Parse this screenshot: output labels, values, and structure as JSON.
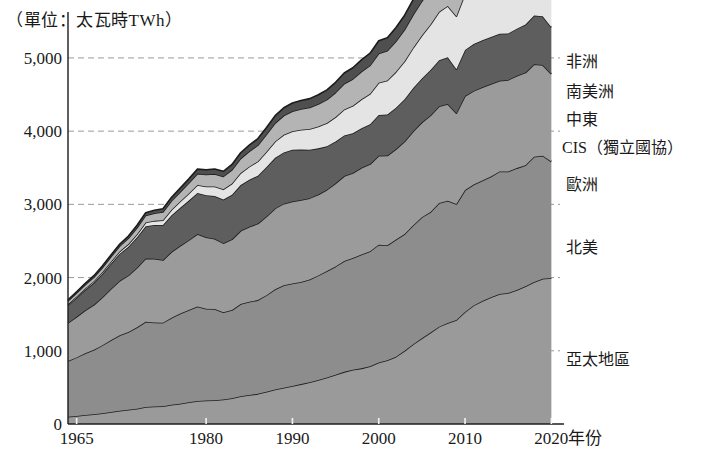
{
  "unit_title": "（單位：太瓦時TWh）",
  "axis": {
    "x_title": "年份",
    "y_ticks": [
      "0",
      "1,000",
      "2,000",
      "3,000",
      "4,000",
      "5,000"
    ],
    "x_ticks": [
      "1965",
      "1980",
      "1990",
      "2000",
      "2010",
      "2020"
    ]
  },
  "series_labels": {
    "africa": "非洲",
    "south_america": "南美洲",
    "middle_east": "中東",
    "cis": "CIS（獨立國協）",
    "europe": "歐洲",
    "north_america": "北美",
    "asia_pacific": "亞太地區"
  },
  "colors": {
    "africa": "#4f4f4f",
    "south_america": "#b4b4b4",
    "middle_east": "#e4e4e4",
    "cis": "#5e5e5e",
    "europe": "#9b9b9b",
    "north_america": "#8d8d8d",
    "asia_pacific": "#9a9a9a",
    "outline": "#1c1c1c",
    "grid": "#9a9a9a",
    "axis": "#1c1c1c"
  },
  "chart_data": {
    "type": "area",
    "title": "（單位：太瓦時TWh）",
    "xlabel": "年份",
    "ylabel": "太瓦時TWh",
    "xlim": [
      1964,
      2021
    ],
    "ylim": [
      0,
      5600
    ],
    "grid": true,
    "stacked": true,
    "legend_position": "right-inline",
    "yticks": [
      0,
      1000,
      2000,
      3000,
      4000,
      5000
    ],
    "xticks": [
      1965,
      1980,
      1990,
      2000,
      2010,
      2020
    ],
    "x": [
      1964,
      1965,
      1966,
      1967,
      1968,
      1969,
      1970,
      1971,
      1972,
      1973,
      1974,
      1975,
      1976,
      1977,
      1978,
      1979,
      1980,
      1981,
      1982,
      1983,
      1984,
      1985,
      1986,
      1987,
      1988,
      1989,
      1990,
      1991,
      1992,
      1993,
      1994,
      1995,
      1996,
      1997,
      1998,
      1999,
      2000,
      2001,
      2002,
      2003,
      2004,
      2005,
      2006,
      2007,
      2008,
      2009,
      2010,
      2011,
      2012,
      2013,
      2014,
      2015,
      2016,
      2017,
      2018,
      2019,
      2020
    ],
    "series": [
      {
        "name": "亞太地區",
        "values": [
          100,
          110,
          122,
          133,
          147,
          163,
          182,
          195,
          210,
          232,
          238,
          244,
          262,
          278,
          296,
          315,
          320,
          325,
          335,
          352,
          378,
          395,
          412,
          440,
          470,
          495,
          520,
          545,
          570,
          600,
          635,
          672,
          712,
          742,
          760,
          790,
          840,
          872,
          920,
          1000,
          1090,
          1170,
          1250,
          1330,
          1380,
          1420,
          1530,
          1620,
          1680,
          1730,
          1775,
          1790,
          1830,
          1880,
          1940,
          1985,
          1995
        ]
      },
      {
        "name": "北美",
        "values": [
          760,
          800,
          845,
          880,
          930,
          985,
          1030,
          1060,
          1110,
          1165,
          1150,
          1140,
          1190,
          1230,
          1260,
          1290,
          1255,
          1245,
          1190,
          1205,
          1260,
          1275,
          1280,
          1320,
          1370,
          1400,
          1400,
          1395,
          1405,
          1430,
          1455,
          1480,
          1515,
          1525,
          1555,
          1570,
          1610,
          1570,
          1600,
          1595,
          1625,
          1655,
          1645,
          1690,
          1670,
          1585,
          1665,
          1650,
          1645,
          1650,
          1675,
          1660,
          1665,
          1655,
          1710,
          1680,
          1590
        ]
      },
      {
        "name": "歐洲",
        "values": [
          520,
          555,
          585,
          615,
          655,
          700,
          745,
          775,
          815,
          865,
          870,
          855,
          900,
          925,
          955,
          990,
          975,
          960,
          945,
          965,
          1000,
          1025,
          1045,
          1075,
          1105,
          1115,
          1120,
          1120,
          1110,
          1105,
          1110,
          1135,
          1160,
          1160,
          1185,
          1190,
          1215,
          1225,
          1235,
          1265,
          1285,
          1295,
          1320,
          1320,
          1320,
          1240,
          1285,
          1280,
          1275,
          1265,
          1240,
          1250,
          1260,
          1265,
          1265,
          1240,
          1195
        ]
      },
      {
        "name": "CIS（獨立國協）",
        "values": [
          240,
          260,
          280,
          300,
          320,
          345,
          370,
          390,
          415,
          440,
          460,
          480,
          500,
          520,
          540,
          560,
          575,
          585,
          595,
          610,
          625,
          640,
          655,
          675,
          690,
          700,
          705,
          690,
          660,
          630,
          595,
          570,
          555,
          545,
          540,
          545,
          555,
          560,
          565,
          575,
          590,
          600,
          620,
          630,
          640,
          600,
          630,
          640,
          640,
          640,
          640,
          635,
          645,
          655,
          665,
          665,
          640
        ]
      },
      {
        "name": "中東",
        "values": [
          15,
          17,
          19,
          22,
          25,
          28,
          32,
          37,
          43,
          50,
          57,
          65,
          75,
          86,
          98,
          110,
          120,
          130,
          140,
          152,
          165,
          180,
          195,
          210,
          225,
          240,
          255,
          270,
          285,
          300,
          315,
          335,
          355,
          375,
          395,
          415,
          440,
          465,
          490,
          520,
          550,
          585,
          620,
          660,
          700,
          725,
          765,
          800,
          830,
          860,
          890,
          915,
          945,
          970,
          995,
          1015,
          1000
        ]
      },
      {
        "name": "南美洲",
        "values": [
          45,
          48,
          52,
          56,
          61,
          67,
          73,
          80,
          88,
          97,
          105,
          112,
          122,
          132,
          143,
          155,
          163,
          170,
          177,
          187,
          198,
          210,
          222,
          236,
          250,
          262,
          272,
          282,
          292,
          305,
          320,
          335,
          350,
          365,
          378,
          388,
          400,
          405,
          418,
          432,
          452,
          470,
          490,
          512,
          530,
          530,
          565,
          580,
          595,
          608,
          620,
          625,
          635,
          648,
          662,
          672,
          660
        ]
      },
      {
        "name": "非洲",
        "values": [
          15,
          16,
          18,
          20,
          22,
          24,
          27,
          30,
          33,
          37,
          40,
          43,
          47,
          51,
          56,
          61,
          64,
          67,
          70,
          74,
          79,
          84,
          89,
          95,
          101,
          107,
          112,
          117,
          122,
          127,
          133,
          140,
          147,
          154,
          160,
          166,
          174,
          180,
          187,
          196,
          207,
          216,
          226,
          237,
          247,
          252,
          264,
          274,
          282,
          290,
          298,
          303,
          311,
          320,
          330,
          338,
          332
        ]
      }
    ]
  },
  "label_positions": {
    "africa_y": 62,
    "south_america_y": 92,
    "middle_east_y": 120,
    "cis_y": 148,
    "europe_y": 185,
    "north_america_y": 248,
    "asia_pacific_y": 360
  }
}
